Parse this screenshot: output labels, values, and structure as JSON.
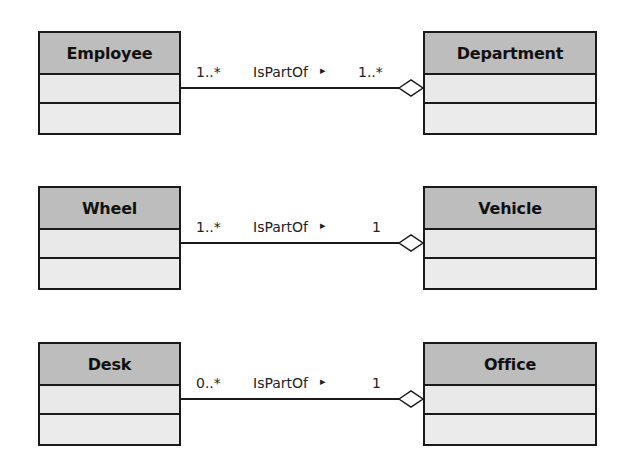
{
  "diagram": {
    "type": "UML class diagram - aggregation",
    "colors": {
      "header_fill": "#bdbdbd",
      "body_fill": "#e9e9e9",
      "line": "#1a1a1a"
    },
    "associations": [
      {
        "part": "Employee",
        "whole": "Department",
        "name": "IsPartOf",
        "direction_glyph": "▸",
        "part_multiplicity": "1..*",
        "whole_multiplicity": "1..*",
        "kind": "aggregation"
      },
      {
        "part": "Wheel",
        "whole": "Vehicle",
        "name": "IsPartOf",
        "direction_glyph": "▸",
        "part_multiplicity": "1..*",
        "whole_multiplicity": "1",
        "kind": "aggregation"
      },
      {
        "part": "Desk",
        "whole": "Office",
        "name": "IsPartOf",
        "direction_glyph": "▸",
        "part_multiplicity": "0..*",
        "whole_multiplicity": "1",
        "kind": "aggregation"
      }
    ]
  }
}
